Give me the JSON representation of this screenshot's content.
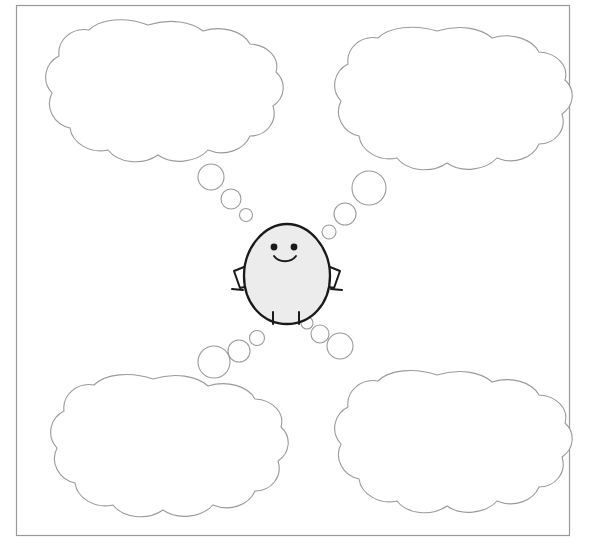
{
  "canvas": {
    "width": 596,
    "height": 560,
    "background": "#ffffff"
  },
  "frame": {
    "name": "worksheet-border",
    "x": 16,
    "y": 5,
    "width": 554,
    "height": 531,
    "stroke": "#9a9a9a",
    "stroke_width": 1.2,
    "fill": "none"
  },
  "character": {
    "name": "egg-mascot",
    "body_fill": "#ececec",
    "body_stroke": "#1a1a1a",
    "body_stroke_width": 2.2,
    "center_x": 287,
    "center_y": 275,
    "body_rx": 43,
    "body_ry": 52,
    "eyes": [
      {
        "cx": 274,
        "cy": 247,
        "r": 3.4
      },
      {
        "cx": 294,
        "cy": 247,
        "r": 3.4
      }
    ],
    "mouth": "smile",
    "arms": [
      {
        "side": "left"
      },
      {
        "side": "right"
      }
    ],
    "legs": 2
  },
  "thought_bubbles": [
    {
      "id": "bubble-top-left",
      "label": "Top left thought bubble",
      "text": "",
      "placeholder": "",
      "cx": 148,
      "cy": 98,
      "rx": 108,
      "ry": 73,
      "stroke": "#9a9a9a",
      "fill": "#ffffff",
      "trail": [
        {
          "cx": 211,
          "cy": 177,
          "r": 13
        },
        {
          "cx": 231,
          "cy": 199,
          "r": 10
        },
        {
          "cx": 246,
          "cy": 215,
          "r": 6.5
        }
      ]
    },
    {
      "id": "bubble-top-right",
      "label": "Top right thought bubble",
      "text": "",
      "placeholder": "",
      "cx": 437,
      "cy": 104,
      "rx": 108,
      "ry": 73,
      "stroke": "#9a9a9a",
      "fill": "#ffffff",
      "trail": [
        {
          "cx": 369,
          "cy": 188,
          "r": 17
        },
        {
          "cx": 345,
          "cy": 214,
          "r": 11
        },
        {
          "cx": 329,
          "cy": 232,
          "r": 7
        }
      ]
    },
    {
      "id": "bubble-bottom-left",
      "label": "Bottom left thought bubble",
      "text": "",
      "placeholder": "",
      "cx": 153,
      "cy": 451,
      "rx": 106,
      "ry": 73,
      "stroke": "#9a9a9a",
      "fill": "#ffffff",
      "trail": [
        {
          "cx": 214,
          "cy": 362,
          "r": 16
        },
        {
          "cx": 239,
          "cy": 351,
          "r": 11
        },
        {
          "cx": 257,
          "cy": 338,
          "r": 7.5
        }
      ]
    },
    {
      "id": "bubble-bottom-right",
      "label": "Bottom right thought bubble",
      "text": "",
      "placeholder": "",
      "cx": 437,
      "cy": 447,
      "rx": 106,
      "ry": 73,
      "stroke": "#9a9a9a",
      "fill": "#ffffff",
      "trail": [
        {
          "cx": 340,
          "cy": 346,
          "r": 13
        },
        {
          "cx": 320,
          "cy": 334,
          "r": 9
        },
        {
          "cx": 307,
          "cy": 323,
          "r": 6
        }
      ]
    }
  ]
}
